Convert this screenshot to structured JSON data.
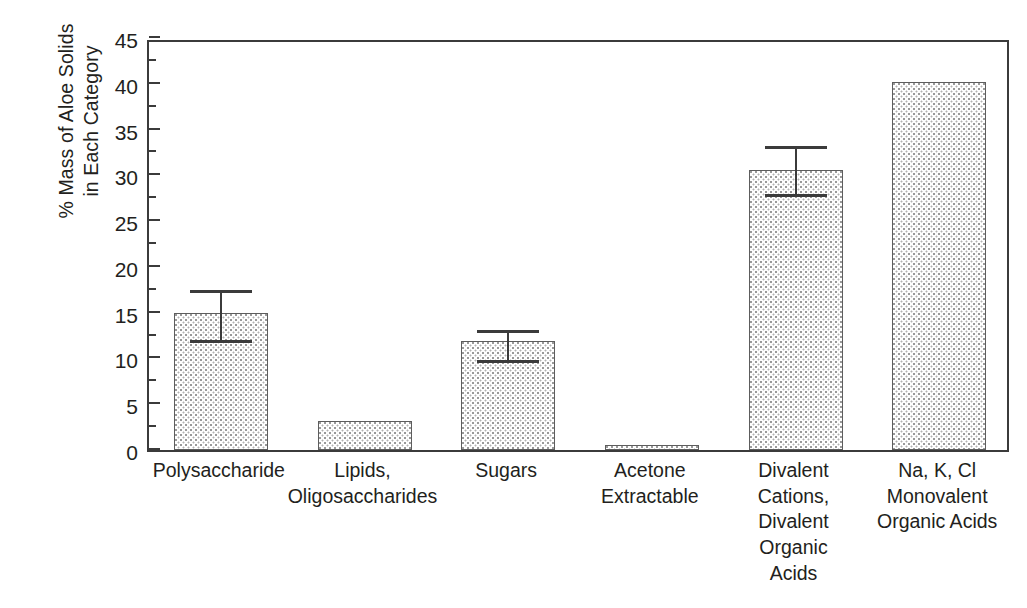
{
  "chart_data": {
    "type": "bar",
    "title": "",
    "xlabel": "",
    "ylabel": "% Mass of Aloe Solids in Each Category",
    "ylabel_lines": [
      "% Mass of Aloe Solids",
      "in Each Category"
    ],
    "ylim": [
      0,
      45
    ],
    "ytick_step": 5,
    "yminor_step": 2.5,
    "ytick_labels": [
      "0",
      "5",
      "10",
      "15",
      "20",
      "25",
      "30",
      "35",
      "40",
      "45"
    ],
    "ytick_values": [
      0,
      5,
      10,
      15,
      20,
      25,
      30,
      35,
      40,
      45
    ],
    "grid": false,
    "legend": null,
    "categories": [
      "Polysaccharide",
      "Lipids, Oligosaccharides",
      "Sugars",
      "Acetone Extractable",
      "Divalent Cations, Divalent Organic Acids",
      "Na, K, Cl Monovalent Organic Acids"
    ],
    "category_label_lines": [
      [
        "Polysaccharide"
      ],
      [
        "Lipids,",
        "Oligosaccharides"
      ],
      [
        "Sugars"
      ],
      [
        "Acetone",
        "Extractable"
      ],
      [
        "Divalent",
        "Cations,",
        "Divalent",
        "Organic",
        "Acids"
      ],
      [
        "Na, K, Cl",
        "Monovalent",
        "Organic Acids"
      ]
    ],
    "values": [
      15.0,
      3.2,
      11.9,
      0.6,
      30.6,
      40.2
    ],
    "errors_upper": [
      17.1,
      null,
      12.8,
      null,
      32.9,
      null
    ],
    "errors_lower": [
      11.7,
      null,
      9.5,
      null,
      27.6,
      null
    ],
    "bar_fill": "stipple-dot",
    "bar_edge_color": "#5d5d5d",
    "axis_color": "#3b3b3b",
    "text_color": "#231f20",
    "background": "#ffffff"
  }
}
